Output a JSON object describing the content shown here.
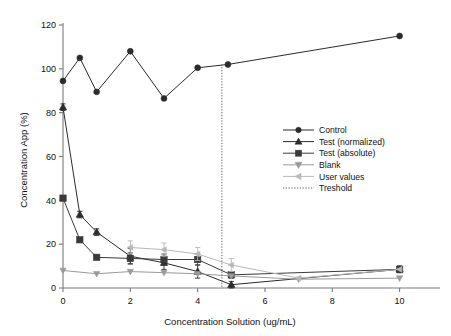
{
  "chart_data": {
    "type": "line",
    "title": "",
    "xlabel": "Concentration Solution (ug/mL)",
    "ylabel": "Concentration App (%)",
    "xlim": [
      0,
      11.2
    ],
    "ylim": [
      0,
      120
    ],
    "xticks": [
      0,
      2,
      4,
      6,
      8,
      10
    ],
    "yticks": [
      0,
      20,
      40,
      60,
      80,
      100,
      120
    ],
    "xtick_labels": [
      "0",
      "2",
      "4",
      "6",
      "8",
      "10"
    ],
    "ytick_labels": [
      "0",
      "20",
      "40",
      "60",
      "80",
      "100",
      "120"
    ],
    "grid": false,
    "legend_position": "right-middle",
    "series": [
      {
        "name": "Control",
        "color": "#2b2b2b",
        "marker": "circle",
        "x": [
          0,
          0.5,
          1,
          2,
          3,
          4,
          4.9,
          10
        ],
        "values": [
          94.5,
          105,
          89.5,
          108,
          86.5,
          100.5,
          102,
          115
        ],
        "errors": [
          0,
          0,
          0,
          0,
          0,
          0,
          0,
          0
        ]
      },
      {
        "name": "Test (normalized)",
        "color": "#2b2b2b",
        "marker": "triangle-up",
        "x": [
          0,
          0.5,
          1,
          2,
          3,
          4,
          5,
          10
        ],
        "values": [
          82.5,
          33.5,
          25.5,
          14.5,
          11.5,
          7.5,
          1.5,
          8.5
        ],
        "errors": [
          1.5,
          1.5,
          1.5,
          3.5,
          3.0,
          3.0,
          1.5,
          1.5
        ]
      },
      {
        "name": "Test (absolute)",
        "color": "#3a3a3a",
        "marker": "square",
        "x": [
          0,
          0.5,
          1,
          2,
          3,
          4,
          5,
          10
        ],
        "values": [
          41,
          22,
          14,
          13.5,
          13,
          13,
          6,
          8.5
        ],
        "errors": [
          0,
          0,
          0,
          2.5,
          2.5,
          2.5,
          1.5,
          1.5
        ]
      },
      {
        "name": "Blank",
        "color": "#9a9a9a",
        "marker": "triangle-down",
        "x": [
          0,
          1,
          2,
          3,
          4,
          5,
          7,
          10
        ],
        "values": [
          8,
          6.5,
          7.5,
          7,
          6.5,
          5.5,
          4,
          4.5
        ],
        "errors": [
          0,
          0,
          0,
          0,
          0,
          0,
          0,
          0
        ]
      },
      {
        "name": "User values",
        "color": "#b8b8b8",
        "marker": "triangle-left",
        "x": [
          2,
          3,
          4,
          5,
          7,
          10
        ],
        "values": [
          18.5,
          17.5,
          15.5,
          10.5,
          4.5,
          8.5
        ],
        "errors": [
          3.0,
          3.0,
          3.0,
          3.0,
          0,
          0
        ]
      }
    ],
    "threshold": {
      "name": "Treshold",
      "x": 4.72,
      "color": "#555555",
      "style": "dotted"
    },
    "legend": [
      {
        "label": "Control",
        "marker": "circle",
        "color": "#2b2b2b"
      },
      {
        "label": "Test (normalized)",
        "marker": "triangle-up",
        "color": "#2b2b2b"
      },
      {
        "label": "Test (absolute)",
        "marker": "square",
        "color": "#3a3a3a"
      },
      {
        "label": "Blank",
        "marker": "triangle-down",
        "color": "#9a9a9a"
      },
      {
        "label": "User values",
        "marker": "triangle-left",
        "color": "#b8b8b8"
      },
      {
        "label": "Treshold",
        "marker": "dotted-line",
        "color": "#555555"
      }
    ]
  },
  "axes": {
    "y_title": "Concentration App (%)",
    "x_title": "Concentration Solution (ug/mL)"
  }
}
